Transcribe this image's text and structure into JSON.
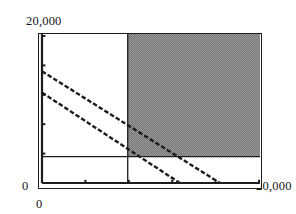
{
  "chart_data": {
    "type": "line",
    "title": "",
    "xlabel": "",
    "ylabel": "",
    "xlim": [
      0,
      20000
    ],
    "ylim": [
      0,
      20000
    ],
    "grid": false,
    "legend": null,
    "axis_tick_labels": {
      "y_top": "20,000",
      "y_bottom": "0",
      "x_left": "0",
      "x_right": "20,000"
    },
    "x_ticks": [
      0,
      4000,
      8000,
      12000,
      16000,
      20000
    ],
    "y_ticks": [
      0,
      4000,
      8000,
      12000,
      16000,
      20000
    ],
    "series": [
      {
        "name": "constraint-line-1",
        "style": "dashed",
        "points": [
          [
            0,
            15200
          ],
          [
            16400,
            0
          ]
        ]
      },
      {
        "name": "constraint-line-2",
        "style": "dashed",
        "points": [
          [
            0,
            12300
          ],
          [
            12700,
            0
          ]
        ]
      }
    ],
    "reference_lines": [
      {
        "name": "vertical-reference",
        "orientation": "vertical",
        "value": 7900
      },
      {
        "name": "horizontal-reference",
        "orientation": "horizontal",
        "value": 3600
      }
    ],
    "shaded_region": {
      "name": "feasible-region",
      "color": "#8c8c8c",
      "x_range": [
        7900,
        20000
      ],
      "y_range": [
        3600,
        20000
      ]
    }
  },
  "labels": {
    "y_top": "20,000",
    "y_zero": "0",
    "x_zero": "0",
    "x_max": "20,000"
  }
}
